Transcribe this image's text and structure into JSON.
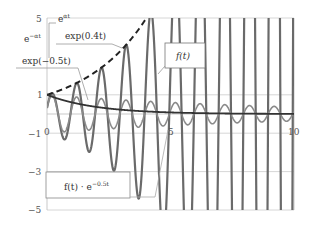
{
  "chart_data": {
    "type": "line",
    "title": "",
    "xlabel": "",
    "ylabel": "",
    "xlim": [
      0,
      10
    ],
    "ylim": [
      -5,
      5
    ],
    "x_ticks": [
      "0",
      "5",
      "10"
    ],
    "y_ticks": [
      "5",
      "1",
      "-1",
      "-3",
      "-5"
    ],
    "grid": true,
    "series": [
      {
        "name": "f(t)",
        "formula": "exp(0.4t)*cos(2*pi*(t-0.2))",
        "style": "thick-gray"
      },
      {
        "name": "exp(0.4t)",
        "formula": "exp(0.4t)",
        "style": "dashed"
      },
      {
        "name": "exp(-0.5t)",
        "formula": "exp(-0.5t)",
        "style": "solid-dark"
      },
      {
        "name": "f(t) · e^{-0.5t}",
        "formula": "exp(-0.1t)*cos(2*pi*(t-0.2))",
        "style": "thin-gray"
      }
    ],
    "annotations": [
      {
        "text": "e^{αt}",
        "target": "upper-left"
      },
      {
        "text": "e^{-αt}",
        "target": "left"
      },
      {
        "text": "exp(0.4t)",
        "target": "dashed envelope"
      },
      {
        "text": "exp(-0.5t)",
        "target": "decaying curve"
      },
      {
        "text": "f(t)",
        "target": "oscillating curve"
      },
      {
        "text": "f(t) · e^{-0.5t}",
        "target": "damped product"
      }
    ]
  },
  "labels": {
    "ealpha": "e",
    "ealpha_sup": "αt",
    "eneg": "e",
    "eneg_sup": "−αt",
    "exp04": "exp(0.4t)",
    "expneg05": "exp(−0.5t)",
    "ft": "f(t)",
    "product": "f(t) · e",
    "product_sup": "−0.5t"
  },
  "ticks": {
    "y5": "5",
    "y1": "1",
    "ym1": "−1",
    "ym3": "−3",
    "ym5": "−5",
    "x0": "0",
    "x5": "5",
    "x10": "10"
  }
}
